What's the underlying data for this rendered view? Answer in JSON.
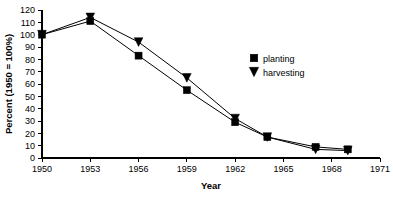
{
  "chart_data": {
    "type": "line",
    "title": "",
    "xlabel": "Year",
    "ylabel": "Percent (1950 = 100%)",
    "xlim": [
      1950,
      1971
    ],
    "ylim": [
      0,
      120
    ],
    "xticks": [
      1950,
      1953,
      1956,
      1959,
      1962,
      1965,
      1968,
      1971
    ],
    "yticks": [
      0,
      10,
      20,
      30,
      40,
      50,
      60,
      70,
      80,
      90,
      100,
      110,
      120
    ],
    "grid": false,
    "legend_position": "upper right",
    "series": [
      {
        "name": "planting",
        "marker": "square",
        "color": "#000000",
        "x": [
          1950,
          1953,
          1956,
          1959,
          1962,
          1964,
          1967,
          1969
        ],
        "values": [
          100,
          111,
          83,
          55,
          29,
          17,
          9,
          7
        ]
      },
      {
        "name": "harvesting",
        "marker": "triangle-down",
        "color": "#000000",
        "x": [
          1950,
          1953,
          1956,
          1959,
          1962,
          1964,
          1967,
          1969
        ],
        "values": [
          100,
          114,
          94,
          65,
          32,
          17,
          7,
          6
        ]
      }
    ]
  },
  "legend": {
    "items": [
      {
        "label": "planting",
        "marker": "square"
      },
      {
        "label": "harvesting",
        "marker": "triangle-down"
      }
    ]
  },
  "axes": {
    "x_title": "Year",
    "y_title": "Percent (1950 = 100%)"
  }
}
